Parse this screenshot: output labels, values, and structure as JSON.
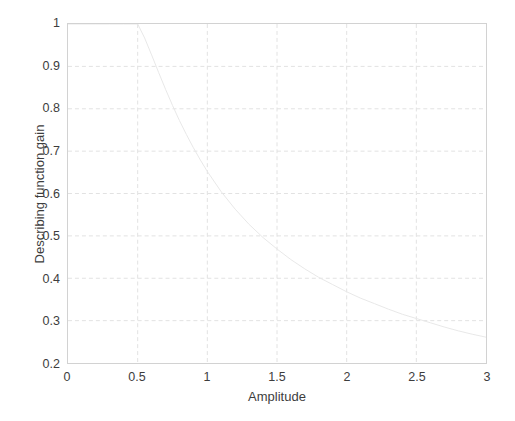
{
  "figure": {
    "background_color": "#ffffff",
    "axes_box_color": "#d2d2d2",
    "grid_color": "#e2e2e2",
    "curve_color": "#e8e8e8",
    "text_color": "#3d3d3d"
  },
  "chart_data": {
    "type": "line",
    "title": "",
    "subtitle": "",
    "xlabel": "Amplitude",
    "ylabel": "Describing function gain",
    "xlim": [
      0,
      3
    ],
    "ylim": [
      0.2,
      1
    ],
    "xticks": [
      "0",
      "0.5",
      "1",
      "1.5",
      "2",
      "2.5",
      "3"
    ],
    "xtick_values": [
      0,
      0.5,
      1,
      1.5,
      2,
      2.5,
      3
    ],
    "yticks": [
      "0.2",
      "0.3",
      "0.4",
      "0.5",
      "0.6",
      "0.7",
      "0.8",
      "0.9",
      "1"
    ],
    "ytick_values": [
      0.2,
      0.3,
      0.4,
      0.5,
      0.6,
      0.7,
      0.8,
      0.9,
      1.0
    ],
    "grid": true,
    "grid_style": "dashed",
    "legend": null,
    "legend_position": "none",
    "annotations": [],
    "series": [
      {
        "name": "Describing function gain",
        "color": "#e8e8e8",
        "line_width": 1,
        "x": [
          0.0,
          0.1,
          0.2,
          0.3,
          0.4,
          0.5,
          0.55,
          0.6,
          0.65,
          0.7,
          0.75,
          0.8,
          0.85,
          0.9,
          0.95,
          1.0,
          1.1,
          1.2,
          1.3,
          1.4,
          1.5,
          1.6,
          1.7,
          1.8,
          1.9,
          2.0,
          2.1,
          2.2,
          2.3,
          2.4,
          2.5,
          2.6,
          2.7,
          2.8,
          2.9,
          3.0
        ],
        "y": [
          1.0,
          1.0,
          1.0,
          1.0,
          1.0,
          1.0,
          0.967,
          0.927,
          0.886,
          0.846,
          0.808,
          0.772,
          0.739,
          0.708,
          0.679,
          0.652,
          0.604,
          0.563,
          0.527,
          0.496,
          0.469,
          0.444,
          0.422,
          0.402,
          0.385,
          0.368,
          0.353,
          0.34,
          0.327,
          0.315,
          0.305,
          0.295,
          0.285,
          0.276,
          0.268,
          0.261
        ]
      }
    ]
  }
}
